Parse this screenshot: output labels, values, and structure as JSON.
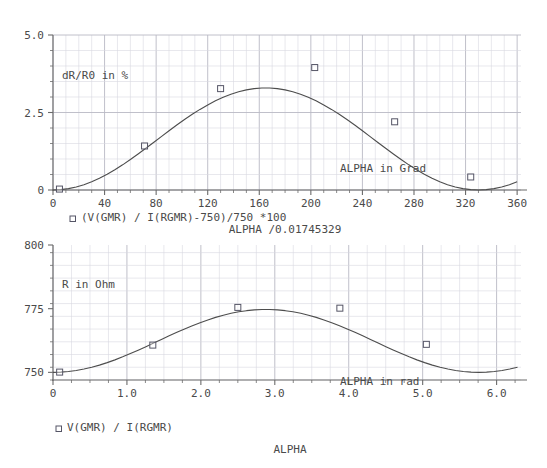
{
  "chart_data": [
    {
      "type": "line",
      "id": "top",
      "title": "",
      "xlabel": "ALPHA /0.01745329",
      "ylabel": "",
      "annotation_y": "dR/R0 in %",
      "annotation_x": "ALPHA in Grad",
      "legend": [
        {
          "marker": "open-square",
          "label": "(V(GMR) / I(RGMR)-750)/750 *100"
        }
      ],
      "xlim": [
        0,
        363
      ],
      "ylim": [
        0,
        5.0
      ],
      "xticks": [
        0,
        40,
        80,
        120,
        160,
        200,
        240,
        280,
        320,
        360
      ],
      "xtick_labels": [
        "0",
        "40",
        "80",
        "120",
        "160",
        "200",
        "240",
        "280",
        "320",
        "360"
      ],
      "yticks": [
        0,
        2.5,
        5.0
      ],
      "ytick_labels": [
        "0",
        "2.5",
        "5.0"
      ],
      "grid": true,
      "minor_grid": true,
      "x": [
        0,
        6,
        12,
        18,
        24,
        30,
        36,
        42,
        48,
        54,
        60,
        66,
        72,
        78,
        84,
        90,
        96,
        102,
        108,
        114,
        120,
        126,
        132,
        138,
        144,
        150,
        156,
        162,
        168,
        174,
        180,
        186,
        192,
        198,
        204,
        210,
        216,
        222,
        228,
        234,
        240,
        246,
        252,
        258,
        264,
        270,
        276,
        282,
        288,
        294,
        300,
        306,
        312,
        318,
        324,
        330,
        336,
        342,
        348,
        354,
        360
      ],
      "y": [
        0.0,
        0.011,
        0.044,
        0.098,
        0.172,
        0.266,
        0.379,
        0.509,
        0.654,
        0.812,
        0.982,
        1.16,
        1.345,
        1.533,
        1.723,
        1.911,
        2.095,
        2.273,
        2.442,
        2.6,
        2.745,
        2.877,
        2.992,
        3.09,
        3.169,
        3.229,
        3.269,
        3.289,
        3.289,
        3.269,
        3.229,
        3.169,
        3.09,
        2.992,
        2.877,
        2.745,
        2.6,
        2.442,
        2.273,
        2.095,
        1.911,
        1.723,
        1.533,
        1.345,
        1.16,
        0.982,
        0.812,
        0.654,
        0.509,
        0.379,
        0.266,
        0.172,
        0.098,
        0.044,
        0.011,
        0.0,
        0.011,
        0.044,
        0.098,
        0.172,
        0.266
      ],
      "markers": [
        {
          "x": 5,
          "y": 0.03
        },
        {
          "x": 71,
          "y": 1.42
        },
        {
          "x": 130,
          "y": 3.27
        },
        {
          "x": 203,
          "y": 3.95
        },
        {
          "x": 265,
          "y": 2.2
        },
        {
          "x": 324,
          "y": 0.42
        }
      ]
    },
    {
      "type": "line",
      "id": "bottom",
      "title": "ALPHA",
      "xlabel": "ALPHA",
      "ylabel": "",
      "annotation_y": "R in Ohm",
      "annotation_x": "ALPHA in rad",
      "legend": [
        {
          "marker": "open-square",
          "label": "V(GMR) / I(RGMR)"
        }
      ],
      "xlim": [
        0,
        6.33
      ],
      "ylim": [
        747,
        800
      ],
      "xticks": [
        0,
        1.0,
        2.0,
        3.0,
        4.0,
        5.0,
        6.0
      ],
      "xtick_labels": [
        "0",
        "1.0",
        "2.0",
        "3.0",
        "4.0",
        "5.0",
        "6.0"
      ],
      "yticks": [
        750,
        775,
        800
      ],
      "ytick_labels": [
        "750",
        "775",
        "800"
      ],
      "grid": true,
      "minor_grid": true,
      "x": [
        0.0,
        0.105,
        0.209,
        0.314,
        0.419,
        0.524,
        0.628,
        0.733,
        0.838,
        0.942,
        1.047,
        1.152,
        1.257,
        1.361,
        1.466,
        1.571,
        1.676,
        1.78,
        1.885,
        1.99,
        2.094,
        2.199,
        2.304,
        2.409,
        2.513,
        2.618,
        2.723,
        2.827,
        2.932,
        3.037,
        3.142,
        3.246,
        3.351,
        3.456,
        3.56,
        3.665,
        3.77,
        3.875,
        3.979,
        4.084,
        4.189,
        4.294,
        4.398,
        4.503,
        4.608,
        4.712,
        4.817,
        4.922,
        5.027,
        5.131,
        5.236,
        5.341,
        5.445,
        5.55,
        5.655,
        5.76,
        5.864,
        5.969,
        6.074,
        6.178,
        6.283
      ],
      "y": [
        750.0,
        750.08,
        750.33,
        750.74,
        751.29,
        751.99,
        752.84,
        753.82,
        754.9,
        756.09,
        757.37,
        758.7,
        760.09,
        761.5,
        762.92,
        764.33,
        765.71,
        767.05,
        768.31,
        769.5,
        770.59,
        771.58,
        772.44,
        773.18,
        773.77,
        774.22,
        774.52,
        774.67,
        774.67,
        774.52,
        774.22,
        773.77,
        773.18,
        772.44,
        771.58,
        770.59,
        769.5,
        768.31,
        767.05,
        765.71,
        764.33,
        762.92,
        761.5,
        760.09,
        758.7,
        757.37,
        756.09,
        754.9,
        753.82,
        752.84,
        751.99,
        751.29,
        750.74,
        750.33,
        750.08,
        750.0,
        750.08,
        750.33,
        750.74,
        751.29,
        751.99
      ],
      "markers": [
        {
          "x": 0.09,
          "y": 750.1
        },
        {
          "x": 1.35,
          "y": 760.7
        },
        {
          "x": 2.5,
          "y": 775.5
        },
        {
          "x": 3.88,
          "y": 775.2
        },
        {
          "x": 5.05,
          "y": 761.0
        }
      ]
    }
  ],
  "style": {
    "curve_color": "#4d4d4d",
    "grid_major_color": "#b9b9c4",
    "grid_minor_color": "#d8d8e0",
    "axis_color": "#6b6b6b",
    "text_color": "#4a4a4a",
    "marker_color": "#555566",
    "background": "#ffffff"
  }
}
